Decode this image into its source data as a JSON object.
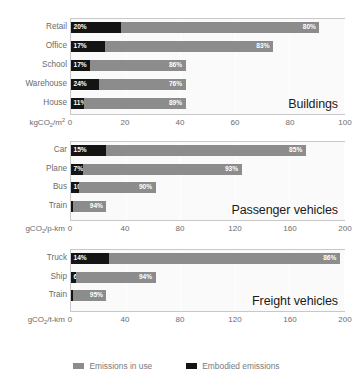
{
  "chart_data": {
    "type": "bar",
    "title": "",
    "subtitle": "",
    "orientation": "horizontal",
    "stacked": true,
    "grid": true,
    "legend_position": "bottom",
    "legend": [
      {
        "name": "Emissions in use",
        "color": "#8c8c8c"
      },
      {
        "name": "Embodied emissions",
        "color": "#141414"
      }
    ],
    "panels": [
      {
        "id": "buildings",
        "title": "Buildings",
        "xlabel": "kgCO",
        "xlabel_sub": "2",
        "xlabel_rest": "/m",
        "xlabel_sup": "2",
        "xlim": [
          0,
          100
        ],
        "ticks": [
          0,
          20,
          40,
          60,
          80,
          100
        ],
        "categories": [
          "Retail",
          "Office",
          "School",
          "Warehouse",
          "House"
        ],
        "totals": [
          91,
          74,
          42,
          42,
          42
        ],
        "series": [
          {
            "name": "Embodied emissions",
            "values": [
              20,
              17,
              17,
              24,
              11
            ]
          },
          {
            "name": "Emissions in use",
            "values": [
              80,
              83,
              86,
              76,
              89
            ]
          }
        ],
        "labels_embodied": [
          "20%",
          "17%",
          "17%",
          "24%",
          "11%"
        ],
        "labels_inuse": [
          "80%",
          "83%",
          "86%",
          "76%",
          "89%"
        ]
      },
      {
        "id": "passenger",
        "title": "Passenger vehicles",
        "xlabel": "gCO",
        "xlabel_sub": "2",
        "xlabel_rest": "/p-km",
        "xlabel_sup": "",
        "xlim": [
          0,
          200
        ],
        "ticks": [
          0,
          40,
          80,
          120,
          160,
          200
        ],
        "categories": [
          "Car",
          "Plane",
          "Bus",
          "Train"
        ],
        "totals": [
          172,
          125,
          62,
          26
        ],
        "series": [
          {
            "name": "Embodied emissions",
            "values": [
              15,
              7,
              10,
              6
            ]
          },
          {
            "name": "Emissions in use",
            "values": [
              85,
              93,
              90,
              94
            ]
          }
        ],
        "labels_embodied": [
          "15%",
          "7%",
          "10%",
          "6%"
        ],
        "labels_inuse": [
          "85%",
          "93%",
          "90%",
          "94%"
        ]
      },
      {
        "id": "freight",
        "title": "Freight vehicles",
        "xlabel": "gCO",
        "xlabel_sub": "2",
        "xlabel_rest": "/t-km",
        "xlabel_sup": "",
        "xlim": [
          0,
          200
        ],
        "ticks": [
          0,
          40,
          80,
          120,
          160,
          200
        ],
        "categories": [
          "Truck",
          "Ship",
          "Train"
        ],
        "totals": [
          197,
          62,
          26
        ],
        "series": [
          {
            "name": "Embodied emissions",
            "values": [
              14,
              6,
              5
            ]
          },
          {
            "name": "Emissions in use",
            "values": [
              86,
              94,
              95
            ]
          }
        ],
        "labels_embodied": [
          "14%",
          "6%",
          "5%"
        ],
        "labels_inuse": [
          "86%",
          "94%",
          "95%"
        ]
      }
    ],
    "colors": {
      "embodied": "#141414",
      "inuse": "#8c8c8c",
      "plot_background": "#fafafa",
      "plot_border": "#c8c8c8",
      "text": "#6b6b6b",
      "title_text": "#1a1a1a"
    }
  }
}
